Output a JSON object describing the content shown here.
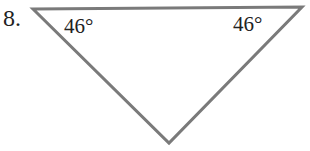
{
  "problem": {
    "number": "8."
  },
  "diagram": {
    "shape": "triangle",
    "stroke_color": "#7a7a7a",
    "vertices": {
      "top_left": [
        33,
        9
      ],
      "top_right": [
        302,
        7
      ],
      "bottom": [
        169,
        143
      ]
    },
    "angles": [
      {
        "vertex": "top_left",
        "label": "46°"
      },
      {
        "vertex": "top_right",
        "label": "46°"
      }
    ]
  }
}
